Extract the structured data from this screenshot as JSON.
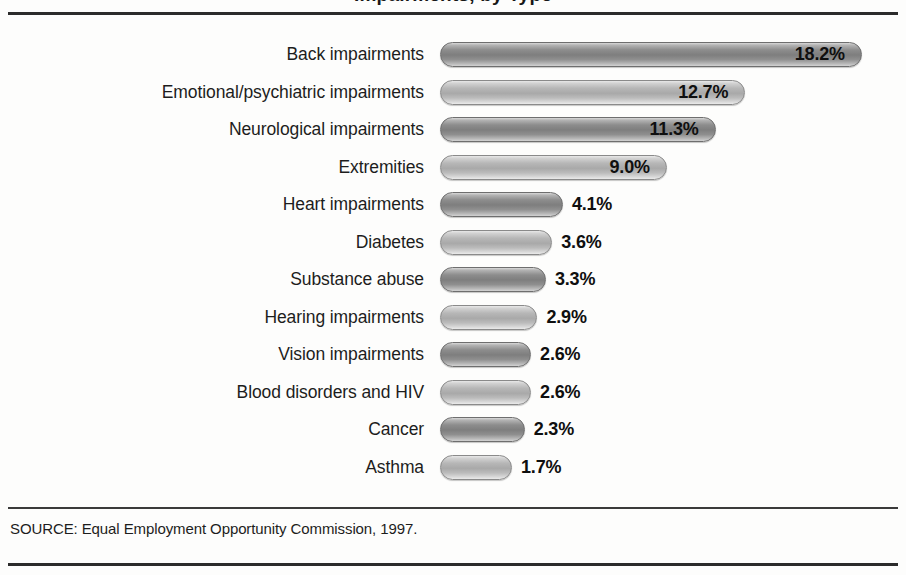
{
  "figure": {
    "title_partial": "Impairments, by Type",
    "source_note": "SOURCE: Equal Employment Opportunity Commission, 1997."
  },
  "chart_data": {
    "type": "bar",
    "orientation": "horizontal",
    "title": "Impairments, by Type",
    "xlabel": "",
    "ylabel": "",
    "xlim": [
      0,
      20
    ],
    "grid": false,
    "legend": false,
    "value_suffix": "%",
    "source": "SOURCE: Equal Employment Opportunity Commission, 1997.",
    "categories": [
      "Back impairments",
      "Emotional/psychiatric impairments",
      "Neurological impairments",
      "Extremities",
      "Heart impairments",
      "Diabetes",
      "Substance abuse",
      "Hearing impairments",
      "Vision impairments",
      "Blood disorders and HIV",
      "Cancer",
      "Asthma"
    ],
    "values": [
      18.2,
      12.7,
      11.3,
      9.0,
      4.1,
      3.6,
      3.3,
      2.9,
      2.6,
      2.6,
      2.3,
      1.7
    ],
    "value_labels": [
      "18.2%",
      "12.7%",
      "11.3%",
      "9.0%",
      "4.1%",
      "3.6%",
      "3.3%",
      "2.9%",
      "2.6%",
      "2.6%",
      "2.3%",
      "1.7%"
    ],
    "label_placement": [
      "inside",
      "inside",
      "inside",
      "inside",
      "outside",
      "outside",
      "outside",
      "outside",
      "outside",
      "outside",
      "outside",
      "outside"
    ],
    "bar_shade": [
      "dark",
      "light",
      "dark",
      "light",
      "dark",
      "light",
      "dark",
      "light",
      "dark",
      "light",
      "dark",
      "light"
    ],
    "colors": {
      "bar_dark_mid": "#7e7e7e",
      "bar_light_mid": "#a9a9a9",
      "text": "#1d1d1d",
      "rule": "#2b2b2b",
      "background": "#fdfdfc"
    }
  }
}
